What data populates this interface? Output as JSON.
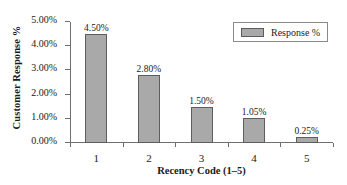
{
  "chart_data": {
    "type": "bar",
    "title": "",
    "subtitle": "",
    "xlabel": "Recency Code (1–5)",
    "ylabel": "Customer Response %",
    "categories": [
      "1",
      "2",
      "3",
      "4",
      "5"
    ],
    "values": [
      4.5,
      2.8,
      1.5,
      1.05,
      0.25
    ],
    "data_labels": [
      "4.50%",
      "2.80%",
      "1.50%",
      "1.05%",
      "0.25%"
    ],
    "series": [
      {
        "name": "Response %",
        "values": [
          4.5,
          2.8,
          1.5,
          1.05,
          0.25
        ],
        "color": "#a9a9a9",
        "border_color": "#5d5d5d"
      }
    ],
    "ylim": [
      0,
      5
    ],
    "ytick_values": [
      0,
      1,
      2,
      3,
      4,
      5
    ],
    "ytick_labels": [
      "0.00%",
      "1.00%",
      "2.00%",
      "3.00%",
      "4.00%",
      "5.00%"
    ],
    "grid": false,
    "legend": {
      "position": "top-right",
      "entries": [
        {
          "label": "Response %",
          "color": "#a9a9a9"
        }
      ]
    },
    "axis_color": "#6f6f6f",
    "background": "#ffffff"
  }
}
